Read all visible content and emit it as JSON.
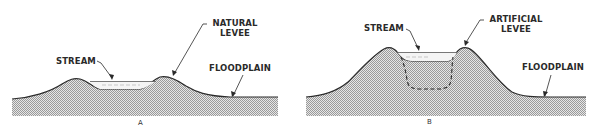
{
  "colors": {
    "ground_fill": "#cfcfcf",
    "outline": "#2a2a2a",
    "water": "#f2f2f2",
    "background": "#ffffff"
  },
  "panels": [
    {
      "id": "A",
      "caption": "A",
      "labels": {
        "stream": "STREAM",
        "levee_line1": "NATURAL",
        "levee_line2": "LEVEE",
        "floodplain": "FLOODPLAIN"
      }
    },
    {
      "id": "B",
      "caption": "B",
      "labels": {
        "stream": "STREAM",
        "levee_line1": "ARTIFICIAL",
        "levee_line2": "LEVEE",
        "floodplain": "FLOODPLAIN"
      }
    }
  ]
}
